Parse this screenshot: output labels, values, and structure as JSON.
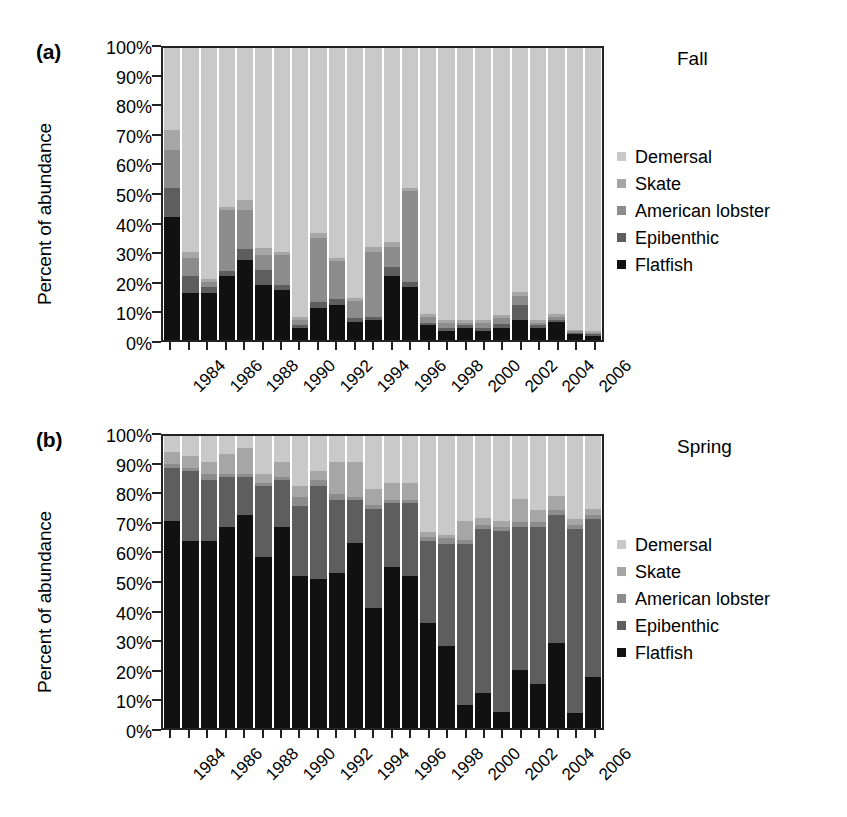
{
  "figure": {
    "panels": [
      {
        "tag": "(a)",
        "season": "Fall",
        "ylabel": "Percent of abundance"
      },
      {
        "tag": "(b)",
        "season": "Spring",
        "ylabel": "Percent of abundance"
      }
    ],
    "ytick_labels": [
      "100%",
      "90%",
      "80%",
      "70%",
      "60%",
      "50%",
      "40%",
      "30%",
      "20%",
      "10%",
      "0%"
    ],
    "xtick_labels": [
      "1984",
      "1986",
      "1988",
      "1990",
      "1992",
      "1994",
      "1996",
      "1998",
      "2000",
      "2002",
      "2004",
      "2006"
    ],
    "legend_title_a": "Fall",
    "legend_title_b": "Spring",
    "legend_entries": [
      {
        "label": "Demersal",
        "color": "#c9c9c9"
      },
      {
        "label": "Skate",
        "color": "#a6a6a6"
      },
      {
        "label": "American lobster",
        "color": "#8c8c8c"
      },
      {
        "label": "Epibenthic",
        "color": "#5e5e5e"
      },
      {
        "label": "Flatfish",
        "color": "#111111"
      }
    ]
  },
  "chart_data": [
    {
      "type": "bar",
      "stacked": true,
      "percent": true,
      "title": "Fall",
      "panel": "(a)",
      "xlabel": "",
      "ylabel": "Percent of abundance",
      "ylim": [
        0,
        100
      ],
      "yticks": [
        0,
        10,
        20,
        30,
        40,
        50,
        60,
        70,
        80,
        90,
        100
      ],
      "grid": false,
      "legend_position": "right",
      "categories": [
        1984,
        1985,
        1986,
        1987,
        1988,
        1989,
        1990,
        1991,
        1992,
        1993,
        1994,
        1995,
        1996,
        1997,
        1998,
        1999,
        2000,
        2001,
        2002,
        2003,
        2004,
        2005,
        2006,
        2007
      ],
      "series": [
        {
          "name": "Flatfish",
          "color": "#111111",
          "values": [
            42,
            16,
            16,
            22,
            27.5,
            19,
            17,
            4,
            11,
            12,
            6,
            7,
            22,
            18,
            5,
            3,
            4,
            3,
            4,
            7,
            4,
            6,
            2,
            1.5
          ]
        },
        {
          "name": "Epibenthic",
          "color": "#5e5e5e",
          "values": [
            10,
            6,
            2,
            1.5,
            3.5,
            5,
            2,
            1,
            2,
            2,
            1.5,
            1,
            3,
            2,
            1,
            1,
            1,
            1,
            1.5,
            5,
            1,
            1,
            0.5,
            0.5
          ]
        },
        {
          "name": "American lobster",
          "color": "#8c8c8c",
          "values": [
            13,
            6,
            2,
            21,
            13.5,
            5,
            10,
            2,
            22,
            13,
            6,
            22,
            7,
            31,
            2,
            2,
            1,
            2,
            2,
            3,
            1,
            1,
            0.5,
            0.5
          ]
        },
        {
          "name": "Skate",
          "color": "#a6a6a6",
          "values": [
            7,
            2,
            1,
            1,
            3.5,
            2.5,
            1,
            1,
            1.5,
            1,
            1,
            2,
            1.5,
            1,
            1,
            1,
            1,
            1,
            1,
            1.5,
            1,
            1,
            0.5,
            0.5
          ]
        },
        {
          "name": "Demersal",
          "color": "#c9c9c9",
          "values": [
            28,
            70,
            79,
            54.5,
            52,
            68.5,
            70,
            92,
            63.5,
            72,
            85.5,
            68,
            66.5,
            48,
            91,
            93,
            93,
            93,
            91.5,
            83.5,
            93,
            91,
            96.5,
            97
          ]
        }
      ]
    },
    {
      "type": "bar",
      "stacked": true,
      "percent": true,
      "title": "Spring",
      "panel": "(b)",
      "xlabel": "",
      "ylabel": "Percent of abundance",
      "ylim": [
        0,
        100
      ],
      "yticks": [
        0,
        10,
        20,
        30,
        40,
        50,
        60,
        70,
        80,
        90,
        100
      ],
      "grid": false,
      "legend_position": "right",
      "categories": [
        1984,
        1985,
        1986,
        1987,
        1988,
        1989,
        1990,
        1991,
        1992,
        1993,
        1994,
        1995,
        1996,
        1997,
        1998,
        1999,
        2000,
        2001,
        2002,
        2003,
        2004,
        2005,
        2006,
        2007
      ],
      "series": [
        {
          "name": "Flatfish",
          "color": "#111111",
          "values": [
            71,
            64,
            64,
            69,
            73,
            58.5,
            69,
            52,
            51,
            53,
            63.5,
            41,
            55,
            52,
            36,
            28,
            8,
            12,
            5.5,
            20,
            15,
            29,
            5,
            17.5
          ]
        },
        {
          "name": "Epibenthic",
          "color": "#5e5e5e",
          "values": [
            18,
            24,
            21,
            17,
            13,
            24.5,
            16,
            24,
            32,
            25,
            14.5,
            34,
            22,
            25,
            28,
            35,
            55,
            56,
            62,
            49,
            54,
            44,
            63,
            54
          ]
        },
        {
          "name": "American lobster",
          "color": "#8c8c8c",
          "values": [
            1.5,
            1,
            2,
            1,
            1,
            1,
            1,
            3,
            2,
            2,
            1,
            1.5,
            1,
            1,
            1.5,
            2,
            1.5,
            1.5,
            1.5,
            1.5,
            1.5,
            1.5,
            1.5,
            1.5
          ]
        },
        {
          "name": "Skate",
          "color": "#a6a6a6",
          "values": [
            4,
            4,
            4,
            7,
            9,
            3,
            5,
            4,
            3,
            11,
            12,
            5.5,
            6,
            6,
            1.5,
            1,
            6.5,
            2.5,
            2,
            8,
            4,
            5,
            2,
            2
          ]
        },
        {
          "name": "Demersal",
          "color": "#c9c9c9",
          "values": [
            5.5,
            7,
            9,
            6,
            4,
            13,
            9,
            17,
            12,
            9,
            9,
            18,
            16,
            16,
            33,
            34,
            29,
            28,
            29,
            21.5,
            25.5,
            20.5,
            28.5,
            25
          ]
        }
      ]
    }
  ]
}
